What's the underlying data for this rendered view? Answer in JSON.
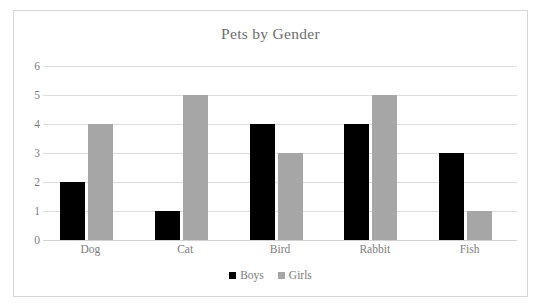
{
  "chart_data": {
    "type": "bar",
    "title": "Pets by Gender",
    "xlabel": "",
    "ylabel": "",
    "categories": [
      "Dog",
      "Cat",
      "Bird",
      "Rabbit",
      "Fish"
    ],
    "series": [
      {
        "name": "Boys",
        "color": "#000000",
        "values": [
          2,
          1,
          4,
          4,
          3
        ]
      },
      {
        "name": "Girls",
        "color": "#a6a6a6",
        "values": [
          4,
          5,
          3,
          5,
          1
        ]
      }
    ],
    "ylim": [
      0,
      6
    ],
    "ytick_step": 1,
    "yticks": [
      "0",
      "1",
      "2",
      "3",
      "4",
      "5",
      "6"
    ],
    "grid": true,
    "grid_axis": "y",
    "grid_color": "#dcdcdc",
    "legend_position": "bottom",
    "plot_background": "#ffffff",
    "border_color": "#d6d6d6",
    "text_color": "#7d7d7d",
    "title_color": "#6d6d6d"
  }
}
